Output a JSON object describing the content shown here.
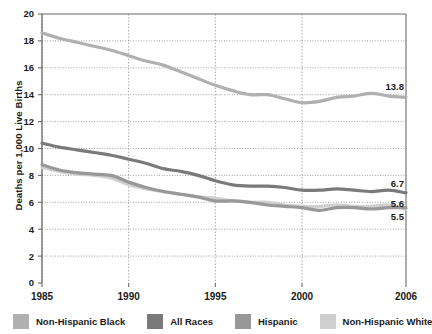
{
  "chart_data": {
    "type": "line",
    "title": "",
    "xlabel": "",
    "ylabel": "Deaths per 1,000 Live Births",
    "xlim": [
      1985,
      2006
    ],
    "ylim": [
      0,
      20
    ],
    "ytick_step": 2,
    "yticks": [
      "0",
      "2",
      "4",
      "6",
      "8",
      "10",
      "12",
      "14",
      "16",
      "18",
      "20"
    ],
    "xticks": [
      "1985",
      "1990",
      "1995",
      "2000",
      "2006"
    ],
    "xtick_values": [
      1985,
      1990,
      1995,
      2000,
      2006
    ],
    "grid": "dotted",
    "legend_position": "bottom",
    "x": [
      1985,
      1986,
      1987,
      1988,
      1989,
      1990,
      1991,
      1992,
      1993,
      1994,
      1995,
      1996,
      1997,
      1998,
      1999,
      2000,
      2001,
      2002,
      2003,
      2004,
      2005,
      2006
    ],
    "series": [
      {
        "name": "Non-Hispanic Black",
        "color": "#b0b0b0",
        "end_label": "13.8",
        "values": [
          18.6,
          18.2,
          17.9,
          17.6,
          17.3,
          16.9,
          16.5,
          16.2,
          15.7,
          15.2,
          14.7,
          14.3,
          14.0,
          14.0,
          13.7,
          13.4,
          13.5,
          13.8,
          13.9,
          14.1,
          13.9,
          13.8
        ]
      },
      {
        "name": "All Races",
        "color": "#7a7a7a",
        "end_label": "6.7",
        "values": [
          10.4,
          10.1,
          9.9,
          9.7,
          9.5,
          9.2,
          8.9,
          8.5,
          8.3,
          8.0,
          7.6,
          7.3,
          7.2,
          7.2,
          7.1,
          6.9,
          6.9,
          7.0,
          6.9,
          6.8,
          6.9,
          6.7
        ]
      },
      {
        "name": "Hispanic",
        "color": "#989898",
        "end_label": "5.6",
        "values": [
          8.8,
          8.4,
          8.2,
          8.1,
          8.0,
          7.5,
          7.1,
          6.8,
          6.6,
          6.4,
          6.1,
          6.1,
          6.0,
          5.8,
          5.7,
          5.6,
          5.4,
          5.6,
          5.6,
          5.5,
          5.6,
          5.6
        ]
      },
      {
        "name": "Non-Hispanic White",
        "color": "#cfcfcf",
        "end_label": "5.5",
        "values": [
          8.6,
          8.3,
          8.1,
          8.0,
          7.8,
          7.3,
          7.0,
          6.8,
          6.6,
          6.4,
          6.3,
          6.1,
          6.0,
          6.0,
          5.8,
          5.7,
          5.7,
          5.8,
          5.7,
          5.7,
          5.8,
          5.5
        ]
      }
    ],
    "value_labels": [
      {
        "text": "13.8",
        "series": "Non-Hispanic Black"
      },
      {
        "text": "6.7",
        "series": "All Races"
      },
      {
        "text": "5.6",
        "series": "Hispanic"
      },
      {
        "text": "5.5",
        "series": "Non-Hispanic White"
      }
    ]
  },
  "legend": {
    "items": [
      {
        "label": "Non-Hispanic Black",
        "color": "#b0b0b0"
      },
      {
        "label": "All Races",
        "color": "#7a7a7a"
      },
      {
        "label": "Hispanic",
        "color": "#989898"
      },
      {
        "label": "Non-Hispanic White",
        "color": "#cfcfcf"
      }
    ]
  },
  "colors": {
    "axis": "#6b6b6b",
    "grid": "#8a8a8a",
    "text": "#1a1a1a",
    "background": "#ffffff"
  }
}
